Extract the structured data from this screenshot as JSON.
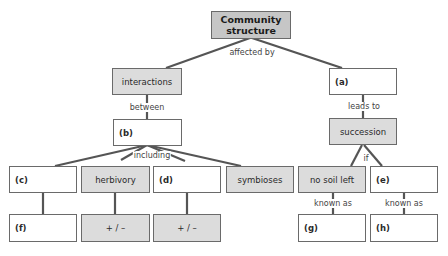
{
  "diagram": {
    "type": "concept-map",
    "root": {
      "label": "Community structure"
    },
    "link_labels": {
      "affected_by": "affected by",
      "between": "between",
      "leads_to": "leads to",
      "including": "including",
      "if": "if",
      "known_as_g": "known as",
      "known_as_h": "known as"
    },
    "nodes": {
      "interactions": "interactions",
      "a": "(a)",
      "b": "(b)",
      "succession": "succession",
      "c": "(c)",
      "herbivory": "herbivory",
      "d": "(d)",
      "symbioses": "symbioses",
      "no_soil_left": "no soil left",
      "e": "(e)",
      "f": "(f)",
      "herbivory_effect": "+ / –",
      "d_effect": "+ / –",
      "g": "(g)",
      "h": "(h)"
    },
    "colors": {
      "root_fill": "#c6c6c6",
      "concept_fill": "#dcdcdc",
      "blank_fill": "#ffffff",
      "line": "#555555",
      "border": "#6a6a6a"
    }
  }
}
